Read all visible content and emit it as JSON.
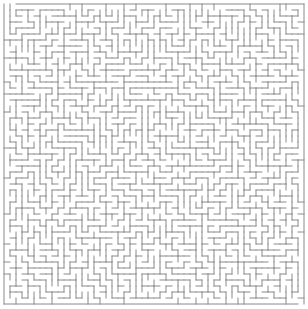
{
  "maze": {
    "title": "Maze puzzle",
    "columns": 50,
    "rows": 50,
    "seed": 20240611,
    "wall_color": "#8a8a8a",
    "background_color": "#ffffff",
    "entrance": "top-left",
    "exit": "bottom-right"
  }
}
